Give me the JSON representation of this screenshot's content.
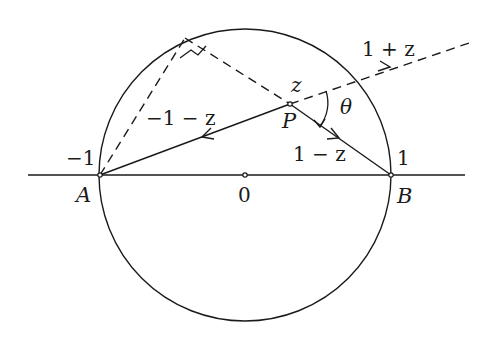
{
  "diagram": {
    "colors": {
      "stroke": "#1a1a1a",
      "background": "#ffffff"
    },
    "labels": {
      "minus_one": "−1",
      "A": "A",
      "zero": "0",
      "one": "1",
      "B": "B",
      "z": "z",
      "P": "P",
      "theta": "θ",
      "minus_one_minus_z": "−1 − z",
      "one_minus_z": "1 − z",
      "one_plus_z": "1 + z"
    },
    "points": {
      "A": {
        "label": "A",
        "value": "-1"
      },
      "O": {
        "label": "0"
      },
      "B": {
        "label": "B",
        "value": "1"
      },
      "P": {
        "label": "P",
        "value": "z"
      }
    },
    "vectors": [
      {
        "from": "P",
        "to": "A",
        "label": "−1 − z",
        "style": "solid"
      },
      {
        "from": "P",
        "to": "B",
        "label": "1 − z",
        "style": "solid"
      },
      {
        "from": "P",
        "direction": "1+z",
        "label": "1 + z",
        "style": "dashed"
      }
    ],
    "annotations": [
      "right-angle marker at top of circle on dashed lines from A",
      "angle θ between 1+z and 1−z at P"
    ]
  }
}
